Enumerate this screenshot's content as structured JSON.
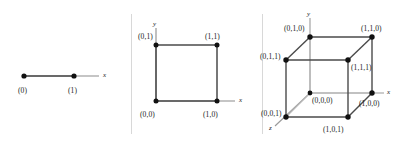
{
  "figure": {
    "background_color": "#ffffff",
    "ink_color": "#1a1a1a",
    "edge_color": "#4a4a4a",
    "hidden_edge_color": "#b0b0b0",
    "divider_color": "#d8d8d8"
  },
  "panels": [
    {
      "id": "one-dimensional",
      "dimension": 1,
      "axes": [
        {
          "name": "x",
          "label": "x"
        }
      ],
      "vertices": [
        {
          "label": "(0)",
          "coords": [
            0
          ]
        },
        {
          "label": "(1)",
          "coords": [
            1
          ]
        }
      ],
      "edges": [
        [
          "(0)",
          "(1)"
        ]
      ]
    },
    {
      "id": "two-dimensional",
      "dimension": 2,
      "axes": [
        {
          "name": "x",
          "label": "x"
        },
        {
          "name": "y",
          "label": "y"
        }
      ],
      "vertices": [
        {
          "label": "(0,0)",
          "coords": [
            0,
            0
          ]
        },
        {
          "label": "(1,0)",
          "coords": [
            1,
            0
          ]
        },
        {
          "label": "(0,1)",
          "coords": [
            0,
            1
          ]
        },
        {
          "label": "(1,1)",
          "coords": [
            1,
            1
          ]
        }
      ],
      "edges": [
        [
          "(0,0)",
          "(1,0)"
        ],
        [
          "(1,0)",
          "(1,1)"
        ],
        [
          "(1,1)",
          "(0,1)"
        ],
        [
          "(0,1)",
          "(0,0)"
        ]
      ]
    },
    {
      "id": "three-dimensional",
      "dimension": 3,
      "axes": [
        {
          "name": "x",
          "label": "x"
        },
        {
          "name": "y",
          "label": "y"
        },
        {
          "name": "z",
          "label": "z"
        }
      ],
      "vertices": [
        {
          "label": "(0,0,0)",
          "coords": [
            0,
            0,
            0
          ]
        },
        {
          "label": "(1,0,0)",
          "coords": [
            1,
            0,
            0
          ]
        },
        {
          "label": "(0,1,0)",
          "coords": [
            0,
            1,
            0
          ]
        },
        {
          "label": "(1,1,0)",
          "coords": [
            1,
            1,
            0
          ]
        },
        {
          "label": "(0,0,1)",
          "coords": [
            0,
            0,
            1
          ]
        },
        {
          "label": "(1,0,1)",
          "coords": [
            1,
            0,
            1
          ]
        },
        {
          "label": "(0,1,1)",
          "coords": [
            0,
            1,
            1
          ]
        },
        {
          "label": "(1,1,1)",
          "coords": [
            1,
            1,
            1
          ]
        }
      ],
      "edges": [
        [
          "(0,0,1)",
          "(1,0,1)"
        ],
        [
          "(1,0,1)",
          "(1,1,1)"
        ],
        [
          "(1,1,1)",
          "(0,1,1)"
        ],
        [
          "(0,1,1)",
          "(0,0,1)"
        ],
        [
          "(0,1,1)",
          "(0,1,0)"
        ],
        [
          "(0,1,0)",
          "(1,1,0)"
        ],
        [
          "(1,1,0)",
          "(1,1,1)"
        ],
        [
          "(1,1,0)",
          "(1,0,0)"
        ],
        [
          "(1,0,0)",
          "(1,0,1)"
        ],
        [
          "(0,0,0)",
          "(0,1,0)"
        ],
        [
          "(0,0,0)",
          "(1,0,0)"
        ],
        [
          "(0,0,0)",
          "(0,0,1)"
        ]
      ]
    }
  ]
}
